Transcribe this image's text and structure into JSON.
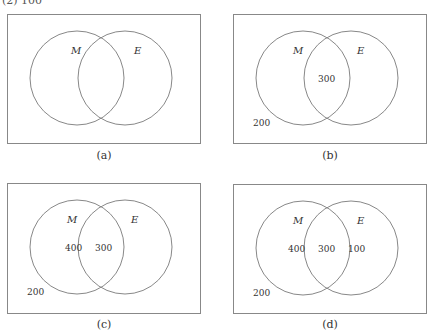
{
  "header": {
    "partial_text": "(2) 100"
  },
  "panels": [
    {
      "id": "a",
      "caption": "(a)",
      "set1": "M",
      "set2": "E",
      "outside": "",
      "only_m": "",
      "both": "",
      "only_e": ""
    },
    {
      "id": "b",
      "caption": "(b)",
      "set1": "M",
      "set2": "E",
      "outside": "200",
      "only_m": "",
      "both": "300",
      "only_e": ""
    },
    {
      "id": "c",
      "caption": "(c)",
      "set1": "M",
      "set2": "E",
      "outside": "200",
      "only_m": "400",
      "both": "300",
      "only_e": ""
    },
    {
      "id": "d",
      "caption": "(d)",
      "set1": "M",
      "set2": "E",
      "outside": "200",
      "only_m": "400",
      "both": "300",
      "only_e": "100"
    }
  ],
  "colors": {
    "stroke": "#888888",
    "text": "#333333"
  }
}
